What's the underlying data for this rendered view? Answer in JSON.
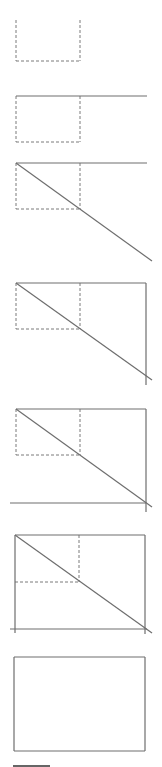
{
  "diagram": {
    "title": "",
    "colors": {
      "solid": "#6e6e6e",
      "dashed": "#7a7a7a",
      "bar": "#333333",
      "background": "#ffffff"
    },
    "steps": [
      {
        "id": "step-1",
        "dashed": [
          [
            16,
            20,
            16,
            61
          ],
          [
            16,
            61,
            80,
            61
          ],
          [
            80,
            20,
            80,
            61
          ]
        ],
        "solid": []
      },
      {
        "id": "step-2",
        "dashed": [
          [
            16,
            96,
            16,
            142
          ],
          [
            16,
            142,
            80,
            142
          ],
          [
            80,
            96,
            80,
            142
          ]
        ],
        "solid": [
          [
            16,
            96,
            147,
            96
          ]
        ]
      },
      {
        "id": "step-3",
        "dashed": [
          [
            16,
            163,
            16,
            209
          ],
          [
            16,
            209,
            80,
            209
          ],
          [
            80,
            163,
            80,
            209
          ]
        ],
        "solid": [
          [
            16,
            163,
            147,
            163
          ],
          [
            16,
            163,
            152,
            261
          ]
        ]
      },
      {
        "id": "step-4",
        "dashed": [
          [
            16,
            283,
            16,
            329
          ],
          [
            16,
            329,
            80,
            329
          ],
          [
            80,
            283,
            80,
            329
          ]
        ],
        "solid": [
          [
            16,
            283,
            146,
            283
          ],
          [
            146,
            283,
            146,
            385
          ],
          [
            16,
            283,
            152,
            380
          ]
        ]
      },
      {
        "id": "step-5",
        "dashed": [
          [
            16,
            409,
            16,
            455
          ],
          [
            16,
            455,
            80,
            455
          ],
          [
            80,
            409,
            80,
            455
          ]
        ],
        "solid": [
          [
            16,
            409,
            146,
            409
          ],
          [
            146,
            409,
            146,
            512
          ],
          [
            16,
            409,
            152,
            507
          ],
          [
            10,
            503,
            146,
            503
          ]
        ]
      },
      {
        "id": "step-6",
        "dashed": [
          [
            15,
            582,
            79,
            582
          ],
          [
            79,
            535,
            79,
            582
          ]
        ],
        "solid": [
          [
            15,
            535,
            145,
            535
          ],
          [
            15,
            535,
            15,
            633
          ],
          [
            145,
            535,
            145,
            634
          ],
          [
            15,
            535,
            152,
            633
          ],
          [
            10,
            629,
            147,
            629
          ]
        ]
      },
      {
        "id": "step-7",
        "dashed": [],
        "solid": [
          [
            14,
            657,
            145,
            657
          ],
          [
            145,
            657,
            145,
            751
          ],
          [
            145,
            751,
            14,
            751
          ],
          [
            14,
            751,
            14,
            657
          ]
        ]
      }
    ],
    "scale_bar": [
      13,
      766,
      50,
      766
    ]
  }
}
